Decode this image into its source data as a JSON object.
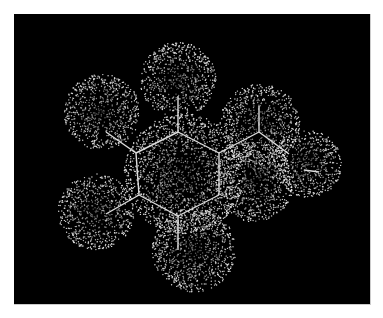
{
  "figure": {
    "background": "#000000",
    "frame_color": "#ffffff",
    "dot_color": "#e8e8e8",
    "bond_color": "#dddddd"
  },
  "atoms": [
    {
      "id": "ring-c1",
      "x": 164,
      "y": 118,
      "r": 0
    },
    {
      "id": "h-top",
      "x": 164,
      "y": 66,
      "r": 38
    },
    {
      "id": "h-left-top",
      "x": 88,
      "y": 98,
      "r": 38
    },
    {
      "id": "h-left-bot",
      "x": 82,
      "y": 198,
      "r": 38
    },
    {
      "id": "h-bottom",
      "x": 180,
      "y": 236,
      "r": 42
    },
    {
      "id": "sub-c",
      "x": 246,
      "y": 110,
      "r": 40
    },
    {
      "id": "sub-o",
      "x": 294,
      "y": 150,
      "r": 34
    },
    {
      "id": "center",
      "x": 170,
      "y": 160,
      "r": 60
    },
    {
      "id": "sub-mid",
      "x": 240,
      "y": 168,
      "r": 40
    }
  ],
  "bonds": [
    [
      122,
      139,
      164,
      118
    ],
    [
      164,
      118,
      205,
      139
    ],
    [
      205,
      139,
      205,
      181
    ],
    [
      205,
      181,
      164,
      202
    ],
    [
      164,
      202,
      125,
      181
    ],
    [
      125,
      181,
      122,
      139
    ],
    [
      164,
      118,
      164,
      82
    ],
    [
      122,
      139,
      92,
      118
    ],
    [
      125,
      181,
      92,
      200
    ],
    [
      164,
      202,
      164,
      236
    ],
    [
      205,
      139,
      245,
      118
    ],
    [
      245,
      118,
      275,
      140
    ],
    [
      245,
      118,
      245,
      92
    ],
    [
      290,
      156,
      305,
      158
    ]
  ]
}
